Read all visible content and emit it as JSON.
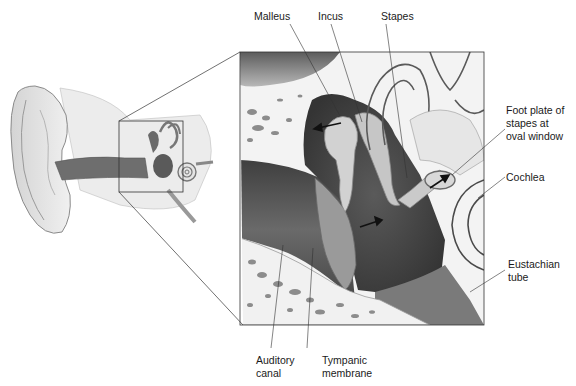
{
  "diagram": {
    "labels": {
      "malleus": "Malleus",
      "incus": "Incus",
      "stapes": "Stapes",
      "foot_plate": "Foot plate of\nstapes at\noval window",
      "cochlea": "Cochlea",
      "eustachian_tube": "Eustachian\ntube",
      "auditory_canal": "Auditory\ncanal",
      "tympanic_membrane": "Tympanic\nmembrane"
    },
    "colors": {
      "bone": "#f2f2f2",
      "bone_pores": "#8a8a8a",
      "cavity_dark": "#4a4a4a",
      "canal": "#5e5e5e",
      "ossicle": "#cfcfcf",
      "line": "#333333"
    }
  }
}
